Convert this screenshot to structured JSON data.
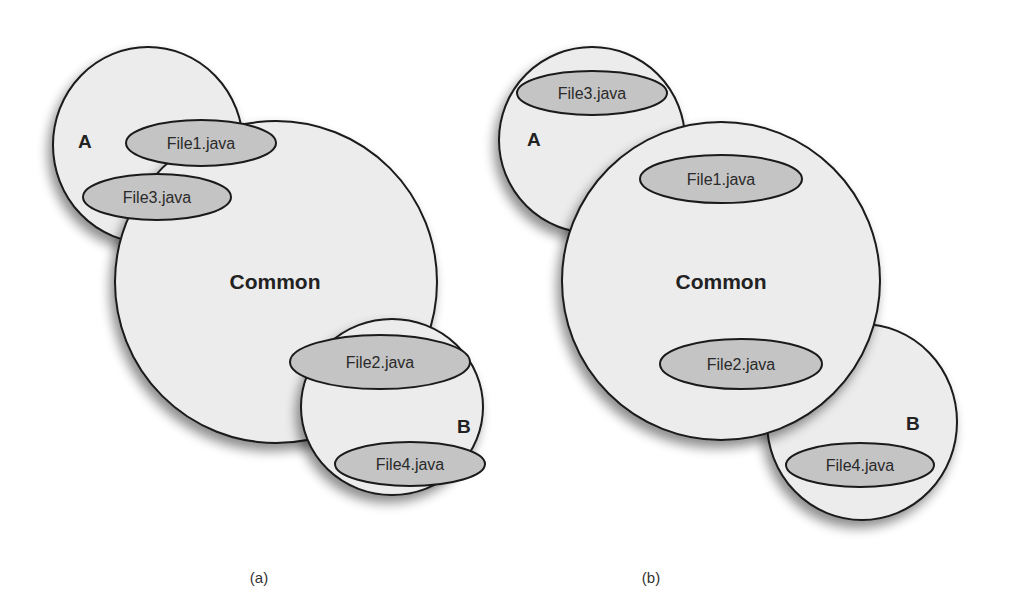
{
  "colors": {
    "circle_fill": "#ececec",
    "file_fill": "#c4c4c4",
    "stroke": "#1a1a1a",
    "background": "#ffffff"
  },
  "panel_a": {
    "caption": "(a)",
    "sets": {
      "a": "A",
      "common": "Common",
      "b": "B"
    },
    "files": [
      "File1.java",
      "File3.java",
      "File2.java",
      "File4.java"
    ]
  },
  "panel_b": {
    "caption": "(b)",
    "sets": {
      "a": "A",
      "common": "Common",
      "b": "B"
    },
    "files": [
      "File3.java",
      "File1.java",
      "File2.java",
      "File4.java"
    ]
  }
}
